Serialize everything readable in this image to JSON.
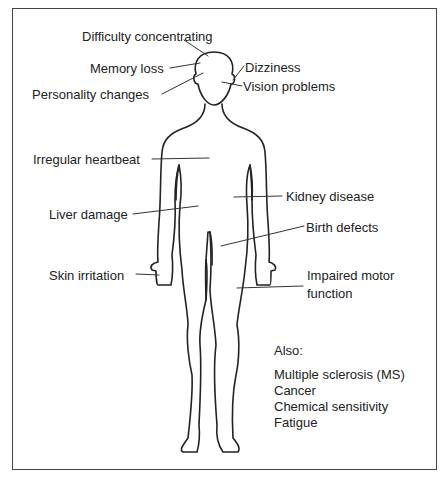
{
  "diagram": {
    "type": "body-outline-annotated",
    "labels": {
      "difficulty_concentrating": "Difficulty concentrating",
      "memory_loss": "Memory loss",
      "personality_changes": "Personality changes",
      "dizziness": "Dizziness",
      "vision_problems": "Vision problems",
      "irregular_heartbeat": "Irregular heartbeat",
      "kidney_disease": "Kidney disease",
      "liver_damage": "Liver damage",
      "birth_defects": "Birth defects",
      "skin_irritation": "Skin irritation",
      "impaired_motor_line1": "Impaired motor",
      "impaired_motor_line2": "function"
    },
    "also": {
      "heading": "Also:",
      "items": [
        "Multiple sclerosis (MS)",
        "Cancer",
        "Chemical sensitivity",
        "Fatigue"
      ]
    },
    "colors": {
      "line": "#222222",
      "frame": "#444444",
      "background": "#ffffff"
    }
  }
}
